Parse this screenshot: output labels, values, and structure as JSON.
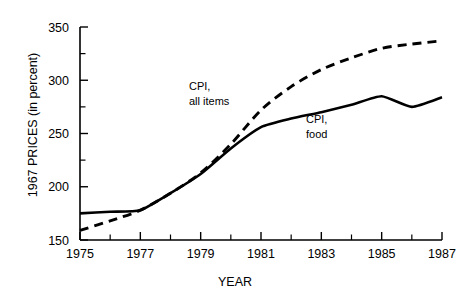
{
  "chart_data": {
    "type": "line",
    "title": "",
    "xlabel": "YEAR",
    "ylabel": "1967 PRICES (in percent)",
    "xlim": [
      1975,
      1987
    ],
    "ylim": [
      150,
      350
    ],
    "grid": false,
    "legend_position": "inline-annotations",
    "x_ticks": [
      1975,
      1976,
      1977,
      1978,
      1979,
      1980,
      1981,
      1982,
      1983,
      1984,
      1985,
      1986,
      1987
    ],
    "x_tick_labels": [
      "1975",
      "",
      "1977",
      "",
      "1979",
      "",
      "1981",
      "",
      "1983",
      "",
      "1985",
      "",
      "1987"
    ],
    "y_ticks": [
      150,
      175,
      200,
      225,
      250,
      275,
      300,
      325,
      350
    ],
    "y_tick_labels": [
      "150",
      "",
      "200",
      "",
      "250",
      "",
      "300",
      "",
      "350"
    ],
    "x": [
      1975,
      1976,
      1977,
      1978,
      1979,
      1980,
      1981,
      1982,
      1983,
      1984,
      1985,
      1986,
      1987
    ],
    "series": [
      {
        "name": "CPI, all items",
        "style": "dashed",
        "color": "#000000",
        "annotation": "CPI,\nall items",
        "values": [
          159,
          168,
          178,
          194,
          213,
          240,
          272,
          294,
          310,
          321,
          330,
          334,
          337
        ]
      },
      {
        "name": "CPI, food",
        "style": "solid",
        "color": "#000000",
        "annotation": "CPI,\nfood",
        "values": [
          175,
          176.5,
          178,
          194,
          212,
          236,
          256,
          264,
          270,
          277,
          285,
          275,
          284
        ]
      }
    ],
    "annotations": [
      {
        "text_line1": "CPI,",
        "text_line2": "all items",
        "x": 1980.2,
        "y": 302
      },
      {
        "text_line1": "CPI,",
        "text_line2": "food",
        "x": 1983.9,
        "y": 281
      }
    ]
  },
  "axis": {
    "y_title": "1967 PRICES (in percent)",
    "x_title": "YEAR",
    "y_labels": [
      "350",
      "300",
      "250",
      "200",
      "150"
    ],
    "x_labels": [
      "1975",
      "1977",
      "1979",
      "1981",
      "1983",
      "1985",
      "1987"
    ]
  },
  "annotations": {
    "all_items_line1": "CPI,",
    "all_items_line2": "all items",
    "food_line1": "CPI,",
    "food_line2": "food"
  }
}
